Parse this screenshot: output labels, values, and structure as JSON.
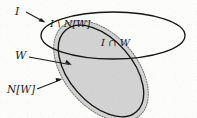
{
  "figure": {
    "type": "venn-diagram",
    "background_color": "#fcfcfb",
    "regions": {
      "shaded_fill_color": "#d2d2d2",
      "outline_color": "#1a1a1a",
      "dotted_boundary_color": "#6f6f6f"
    },
    "labels": {
      "set_i": "I",
      "set_w": "W",
      "neighbourhood": "N[W]",
      "difference": "I \\ N[W]",
      "intersection": "I ∩ W"
    }
  }
}
